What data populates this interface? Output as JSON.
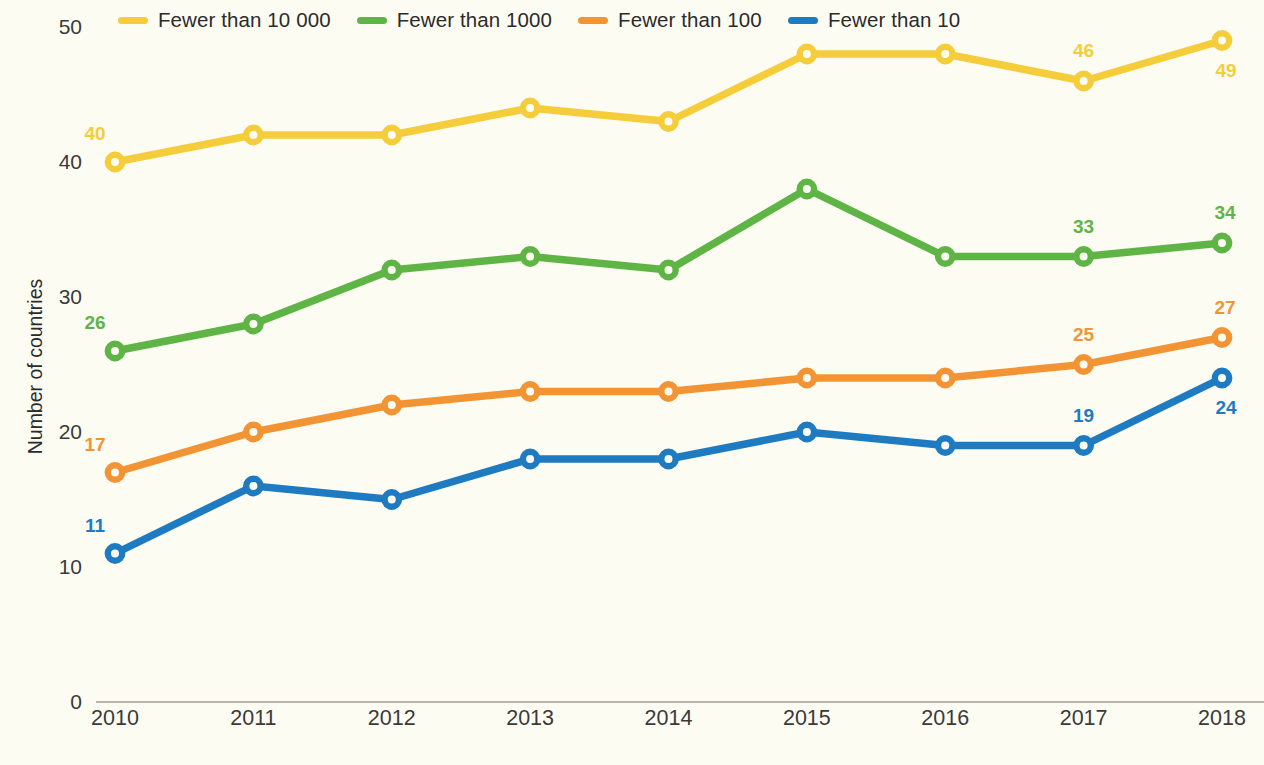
{
  "chart_data": {
    "type": "line",
    "title": "",
    "subtitle": "",
    "xlabel": "",
    "ylabel": "Number of countries",
    "categories": [
      "2010",
      "2011",
      "2012",
      "2013",
      "2014",
      "2015",
      "2016",
      "2017",
      "2018"
    ],
    "x": [
      2010,
      2011,
      2012,
      2013,
      2014,
      2015,
      2016,
      2017,
      2018
    ],
    "ylim": [
      0,
      50
    ],
    "yticks": [
      0,
      10,
      20,
      30,
      40,
      50
    ],
    "ytick_labels": [
      "0",
      "10",
      "20",
      "30",
      "40",
      "50"
    ],
    "grid": false,
    "legend_position": "top",
    "markers": "open-circle",
    "series": [
      {
        "name": "Fewer than 10 000",
        "color": "#f5cd3b",
        "values": [
          40,
          42,
          42,
          44,
          43,
          48,
          48,
          46,
          49
        ],
        "point_labels": [
          {
            "index": 0,
            "text": "40",
            "pos": "above-left"
          },
          {
            "index": 7,
            "text": "46",
            "pos": "above"
          },
          {
            "index": 8,
            "text": "49",
            "pos": "below-right"
          }
        ]
      },
      {
        "name": "Fewer than 1000",
        "color": "#5fb446",
        "values": [
          26,
          28,
          32,
          33,
          32,
          38,
          33,
          33,
          34
        ],
        "point_labels": [
          {
            "index": 0,
            "text": "26",
            "pos": "above-left"
          },
          {
            "index": 7,
            "text": "33",
            "pos": "above"
          },
          {
            "index": 8,
            "text": "34",
            "pos": "above-right"
          }
        ]
      },
      {
        "name": "Fewer than 100",
        "color": "#f29434",
        "values": [
          17,
          20,
          22,
          23,
          23,
          24,
          24,
          25,
          27
        ],
        "point_labels": [
          {
            "index": 0,
            "text": "17",
            "pos": "above-left"
          },
          {
            "index": 7,
            "text": "25",
            "pos": "above"
          },
          {
            "index": 8,
            "text": "27",
            "pos": "above-right"
          }
        ]
      },
      {
        "name": "Fewer than 10",
        "color": "#1e7bc2",
        "values": [
          11,
          16,
          15,
          18,
          18,
          20,
          19,
          19,
          24
        ],
        "point_labels": [
          {
            "index": 0,
            "text": "11",
            "pos": "above-left"
          },
          {
            "index": 7,
            "text": "19",
            "pos": "above"
          },
          {
            "index": 8,
            "text": "24",
            "pos": "below-right"
          }
        ]
      }
    ]
  },
  "colors": {
    "background": "#fdfcf3",
    "axis": "#b9b7ab",
    "tick_text": "#3a3a3a",
    "series_yellow": "#f5cd3b",
    "series_green": "#5fb446",
    "series_orange": "#f29434",
    "series_blue": "#1e7bc2"
  },
  "legend": {
    "items": [
      {
        "label": "Fewer than 10 000",
        "color": "#f5cd3b"
      },
      {
        "label": "Fewer than 1000",
        "color": "#5fb446"
      },
      {
        "label": "Fewer than 100",
        "color": "#f29434"
      },
      {
        "label": "Fewer than 10",
        "color": "#1e7bc2"
      }
    ]
  }
}
